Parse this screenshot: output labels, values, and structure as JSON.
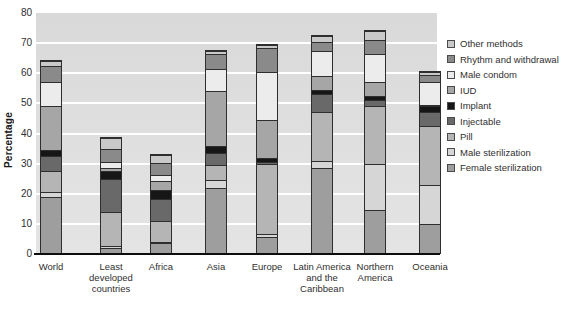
{
  "chart_data": {
    "type": "bar",
    "stacked": true,
    "title": "",
    "xlabel": "",
    "ylabel": "Percentage",
    "ylim": [
      0,
      80
    ],
    "yticks": [
      0,
      10,
      20,
      30,
      40,
      50,
      60,
      70,
      80
    ],
    "grid": true,
    "legend_position": "right",
    "categories": [
      "World",
      "Least developed countries",
      "Africa",
      "Asia",
      "Europe",
      "Latin America and the Caribbean",
      "Northern America",
      "Oceania"
    ],
    "category_ids": [
      "world",
      "least-developed-countries",
      "africa",
      "asia",
      "europe",
      "latin-america-and-the-caribbean",
      "northern-america",
      "oceania"
    ],
    "series": [
      {
        "name": "Female sterilization",
        "color": "#9e9e9e",
        "values": [
          19,
          2,
          3.5,
          22,
          5.5,
          28.5,
          14.5,
          10
        ]
      },
      {
        "name": "Male sterilization",
        "color": "#d6d6d6",
        "values": [
          1.5,
          0.5,
          0.3,
          2.5,
          1,
          2.5,
          15.5,
          13
        ]
      },
      {
        "name": "Pill",
        "color": "#b5b5b5",
        "values": [
          7,
          11.5,
          7,
          5,
          23.5,
          16,
          19,
          19.5
        ]
      },
      {
        "name": "Injectable",
        "color": "#696969",
        "values": [
          5,
          11,
          7.5,
          4,
          0.5,
          6,
          2,
          4.5
        ]
      },
      {
        "name": "Implant",
        "color": "#161616",
        "values": [
          2,
          2.5,
          3,
          2.5,
          1.5,
          1.5,
          1.5,
          2
        ]
      },
      {
        "name": "IUD",
        "color": "#a6a6a6",
        "values": [
          14.5,
          1,
          3,
          18,
          12.5,
          4.5,
          4.5,
          0.5
        ]
      },
      {
        "name": "Male condom",
        "color": "#ececec",
        "values": [
          8,
          2,
          2,
          7.5,
          16,
          8.5,
          9.5,
          7.5
        ]
      },
      {
        "name": "Rhythm and withdrawal",
        "color": "#8a8a8a",
        "values": [
          5.5,
          4.5,
          4,
          5,
          8,
          3,
          4.5,
          2.5
        ]
      },
      {
        "name": "Other methods",
        "color": "#c9c9c9",
        "values": [
          1.5,
          3.5,
          2.5,
          1,
          1,
          2,
          3,
          1
        ]
      }
    ]
  },
  "y_axis": {
    "title": "Percentage"
  },
  "colors": {
    "plot_background": "#dedede",
    "gridline": "#ffffff",
    "axis_line": "#0d0d0d",
    "segment_border": "#2e2e2e"
  }
}
